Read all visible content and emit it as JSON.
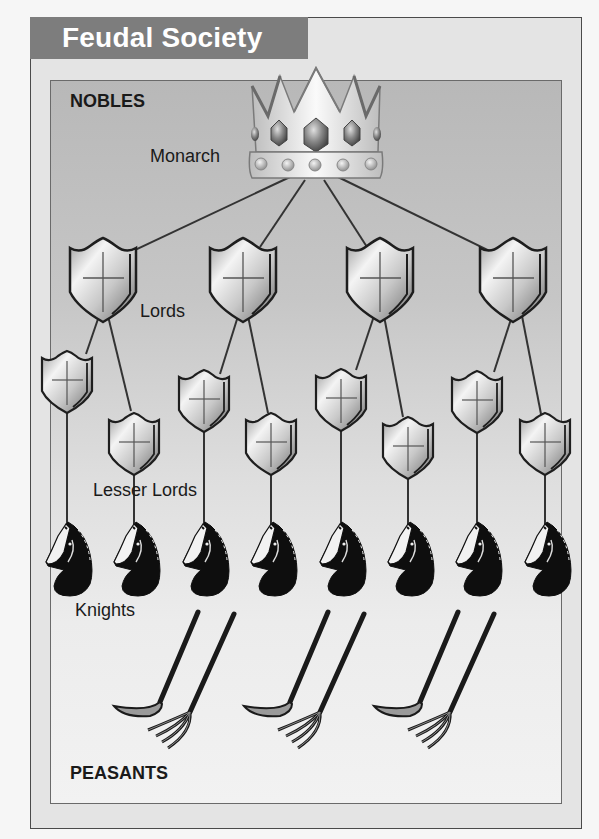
{
  "title": "Feudal Society",
  "labels": {
    "nobles": "NOBLES",
    "monarch": "Monarch",
    "lords": "Lords",
    "lesser_lords": "Lesser Lords",
    "knights": "Knights",
    "peasants": "PEASANTS"
  },
  "hierarchy": [
    {
      "level": "Monarch",
      "icon": "crown-icon",
      "count": 1,
      "group": "NOBLES"
    },
    {
      "level": "Lords",
      "icon": "shield-icon",
      "count": 4,
      "group": "NOBLES"
    },
    {
      "level": "Lesser Lords",
      "icon": "small-shield-icon",
      "count": 8,
      "group": "NOBLES"
    },
    {
      "level": "Knights",
      "icon": "knight-horse-icon",
      "count": 8,
      "group": "NOBLES"
    },
    {
      "level": "Peasants",
      "icon": "scythe-and-pitchfork-icon",
      "count": 3,
      "group": "PEASANTS"
    }
  ],
  "colors": {
    "title_bar": "#7d7d7d",
    "title_text": "#ffffff",
    "panel_top": "#b8b8b8",
    "panel_bottom": "#f2f2f2",
    "line": "#333333"
  }
}
